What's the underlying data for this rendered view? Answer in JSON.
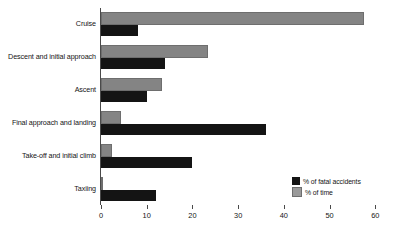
{
  "chart_data": {
    "type": "bar",
    "orientation": "horizontal",
    "title": "",
    "subtitle": "",
    "xlabel": "",
    "ylabel": "",
    "xlim": [
      0,
      63
    ],
    "xticks": [
      0,
      10,
      20,
      30,
      40,
      50,
      60
    ],
    "xtick_labels": [
      "0",
      "10",
      "20",
      "30",
      "40",
      "50",
      "60"
    ],
    "grid": false,
    "legend_position": "bottom-right",
    "categories": [
      "Cruise",
      "Descent and initial approach",
      "Ascent",
      "Final approach and landing",
      "Take-off and initial climb",
      "Taxiing"
    ],
    "series": [
      {
        "name": "% of fatal accidents",
        "color": "#141414",
        "values": [
          8,
          14,
          10,
          36,
          20,
          12
        ]
      },
      {
        "name": "% of time",
        "color": "#848484",
        "values": [
          57,
          23,
          13,
          4,
          2,
          0
        ]
      }
    ]
  },
  "legend": {
    "items": [
      {
        "label": "% of fatal accidents",
        "swatch": "black"
      },
      {
        "label": "% of time",
        "swatch": "gray"
      }
    ]
  }
}
